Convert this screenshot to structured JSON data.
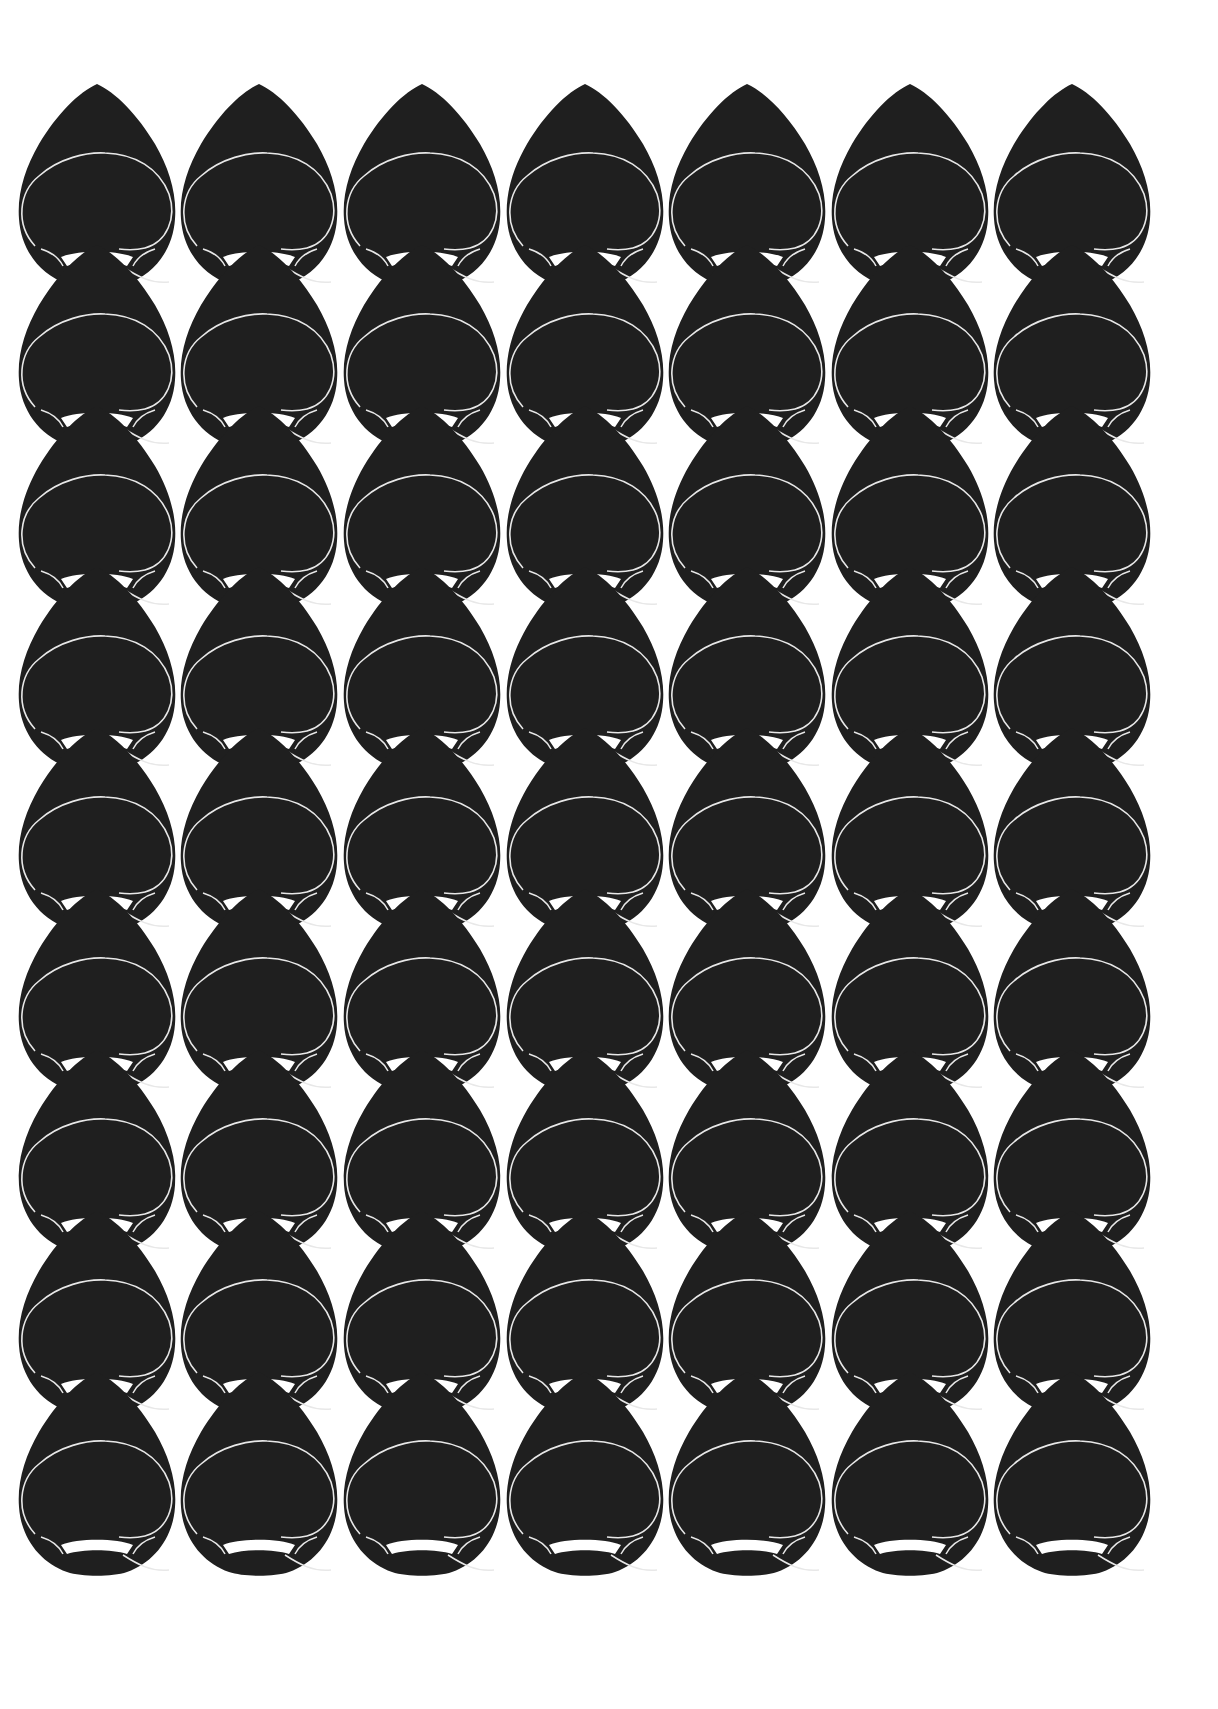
{
  "artwork": {
    "title": "Repeating teardrop cut-paper pattern",
    "motif": "teardrop-face",
    "columns": 7,
    "rows": 9,
    "colors": {
      "background": "#ffffff",
      "motif_fill": "#1f1f1f",
      "line": "#e8e8e8"
    },
    "grid": {
      "origin_x": 97,
      "origin_y": 84,
      "pitch_x": 162.5,
      "pitch_y": 161
    }
  }
}
